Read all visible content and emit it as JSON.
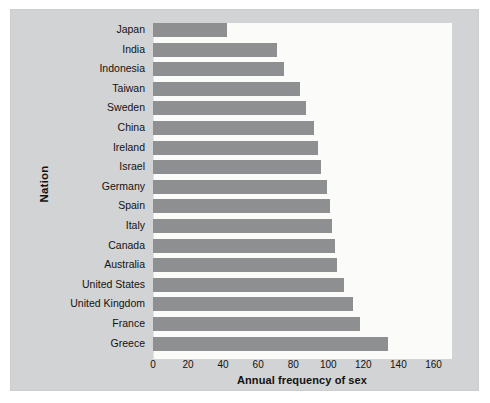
{
  "chart_data": {
    "type": "bar",
    "orientation": "horizontal",
    "title": "",
    "xlabel": "Annual frequency of sex",
    "ylabel": "Nation",
    "xlim": [
      0,
      170
    ],
    "xticks": [
      0,
      20,
      40,
      60,
      80,
      100,
      120,
      140,
      160
    ],
    "grid": false,
    "legend": null,
    "bar_color": "#8e8f90",
    "plot_background": "#fbfbfa",
    "panel_background": "#d2d3d4",
    "categories": [
      "Japan",
      "India",
      "Indonesia",
      "Taiwan",
      "Sweden",
      "China",
      "Ireland",
      "Israel",
      "Germany",
      "Spain",
      "Italy",
      "Canada",
      "Australia",
      "United States",
      "United  Kingdom",
      "France",
      "Greece"
    ],
    "values": [
      42,
      71,
      75,
      84,
      87,
      92,
      94,
      96,
      99,
      101,
      102,
      104,
      105,
      109,
      114,
      118,
      134
    ]
  }
}
